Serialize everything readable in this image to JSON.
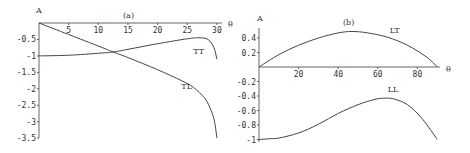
{
  "chart_data": [
    {
      "type": "line",
      "panel": "(a)",
      "title": "(a)",
      "xlabel": "θ",
      "ylabel": "A",
      "xlim": [
        0,
        31
      ],
      "ylim": [
        -3.5,
        0
      ],
      "xticks": [
        5,
        10,
        15,
        20,
        25,
        30
      ],
      "xtick_labels": [
        "5",
        "10",
        "15",
        "20",
        "25",
        "30"
      ],
      "yticks": [
        -0.5,
        -1,
        -1.5,
        -2,
        -2.5,
        -3,
        -3.5
      ],
      "ytick_labels": [
        "-0.5",
        "-1",
        "-1.5",
        "-2",
        "-2.5",
        "-3",
        "-3.5"
      ],
      "grid": false,
      "series": [
        {
          "name": "TT",
          "label_pos": [
            26,
            -0.95
          ],
          "x": [
            0,
            5,
            10,
            12.5,
            15,
            20,
            25,
            27,
            28.5,
            29.5,
            30
          ],
          "y": [
            -1,
            -0.98,
            -0.92,
            -0.88,
            -0.8,
            -0.63,
            -0.48,
            -0.45,
            -0.5,
            -0.75,
            -1.1
          ]
        },
        {
          "name": "TL",
          "label_pos": [
            24,
            -2.0
          ],
          "x": [
            0,
            5,
            10,
            12.5,
            15,
            20,
            24,
            26,
            28,
            29,
            29.6,
            30
          ],
          "y": [
            0,
            -0.35,
            -0.7,
            -0.88,
            -1.05,
            -1.42,
            -1.75,
            -1.95,
            -2.3,
            -2.65,
            -3.0,
            -3.5
          ]
        }
      ]
    },
    {
      "type": "line",
      "panel": "(b)",
      "title": "(b)",
      "xlabel": "θ",
      "ylabel": "A",
      "xlim": [
        0,
        90
      ],
      "ylim": [
        -1,
        0.5
      ],
      "xticks": [
        20,
        40,
        60,
        80
      ],
      "xtick_labels": [
        "20",
        "40",
        "60",
        "80"
      ],
      "yticks": [
        0.4,
        0.2,
        -0.2,
        -0.4,
        -0.6,
        -0.8,
        -1
      ],
      "ytick_labels": [
        "0.4",
        "0.2",
        "-0.2",
        "-0.4",
        "-0.6",
        "-0.8",
        "-1"
      ],
      "grid": false,
      "series": [
        {
          "name": "LT",
          "label_pos": [
            66,
            0.47
          ],
          "x": [
            0,
            10,
            20,
            30,
            40,
            47,
            55,
            65,
            75,
            85,
            90
          ],
          "y": [
            0,
            0.17,
            0.3,
            0.4,
            0.47,
            0.49,
            0.47,
            0.41,
            0.3,
            0.13,
            0
          ]
        },
        {
          "name": "LL",
          "label_pos": [
            65,
            -0.35
          ],
          "x": [
            0,
            5,
            10,
            20,
            30,
            40,
            50,
            58,
            63,
            68,
            75,
            82,
            88,
            90
          ],
          "y": [
            -1,
            -0.99,
            -0.98,
            -0.91,
            -0.79,
            -0.64,
            -0.52,
            -0.45,
            -0.43,
            -0.44,
            -0.52,
            -0.7,
            -0.92,
            -1
          ]
        }
      ]
    }
  ]
}
